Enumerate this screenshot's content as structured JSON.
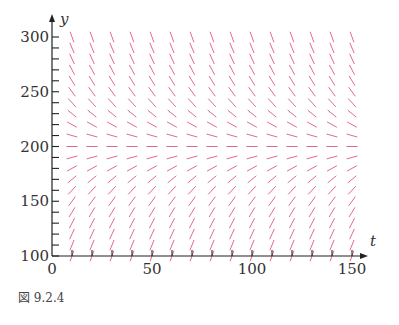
{
  "chart_data": {
    "type": "slope-field",
    "title": "",
    "xlabel": "t",
    "ylabel": "y",
    "xlim": [
      0,
      160
    ],
    "ylim": [
      100,
      305
    ],
    "xticks": [
      0,
      50,
      100,
      150
    ],
    "yticks": [
      100,
      150,
      200,
      250,
      300
    ],
    "y_minor_tick_step": 10,
    "grid_t": [
      10,
      20,
      30,
      40,
      50,
      60,
      70,
      80,
      90,
      100,
      110,
      120,
      130,
      140,
      150
    ],
    "grid_y_start": 100,
    "grid_y_end": 300,
    "grid_y_step": 10,
    "equilibrium_y": 200,
    "slope_function": "dy/dt = k*(200 - y)",
    "segment_color": "#e0507a",
    "grid": false
  },
  "caption": "図 9.2.4"
}
